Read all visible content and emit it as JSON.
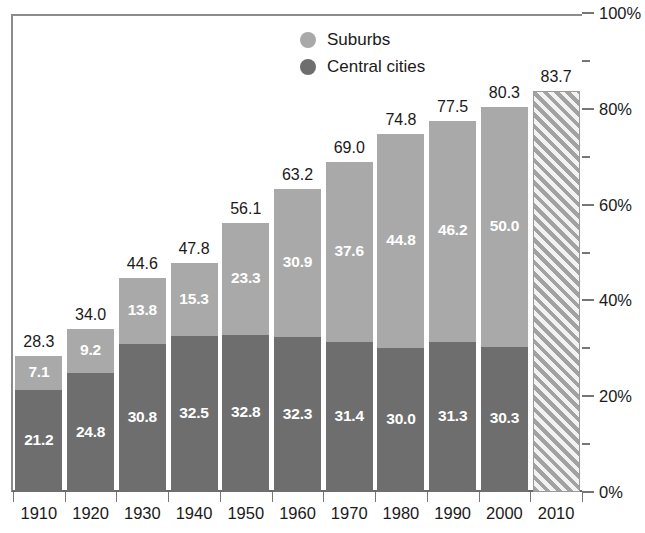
{
  "chart_data": {
    "type": "bar",
    "title": "",
    "subtitle": "",
    "xlabel": "",
    "ylabel": "",
    "ylim": [
      0,
      100
    ],
    "ytick_labels": [
      "0%",
      "20%",
      "40%",
      "60%",
      "80%",
      "100%"
    ],
    "ytick_values": [
      0,
      20,
      40,
      60,
      80,
      100
    ],
    "yminor_values": [
      10,
      30,
      50,
      70,
      90
    ],
    "grid": false,
    "stacked": true,
    "legend_position": "top-center",
    "categories": [
      "1910",
      "1920",
      "1930",
      "1940",
      "1950",
      "1960",
      "1970",
      "1980",
      "1990",
      "2000",
      "2010"
    ],
    "series": [
      {
        "name": "Central cities",
        "color": "#6e6e6e",
        "values": [
          21.2,
          24.8,
          30.8,
          32.5,
          32.8,
          32.3,
          31.4,
          30.0,
          31.3,
          30.3,
          null
        ]
      },
      {
        "name": "Suburbs",
        "color": "#a9a9a9",
        "values": [
          7.1,
          9.2,
          13.8,
          15.3,
          23.3,
          30.9,
          37.6,
          44.8,
          46.2,
          50.0,
          null
        ]
      }
    ],
    "totals": [
      28.3,
      34.0,
      44.6,
      47.8,
      56.1,
      63.2,
      69.0,
      74.8,
      77.5,
      80.3,
      83.7
    ],
    "projected_category": "2010",
    "projected_value": 83.7,
    "annotations": []
  },
  "legend": {
    "items": [
      {
        "label": "Suburbs",
        "color": "#a9a9a9",
        "icon": "circle-icon"
      },
      {
        "label": "Central cities",
        "color": "#6e6e6e",
        "icon": "circle-icon"
      }
    ]
  },
  "bars": [
    {
      "year": "1910",
      "central": "21.2",
      "suburb": "7.1",
      "total": "28.3",
      "projected": false
    },
    {
      "year": "1920",
      "central": "24.8",
      "suburb": "9.2",
      "total": "34.0",
      "projected": false
    },
    {
      "year": "1930",
      "central": "30.8",
      "suburb": "13.8",
      "total": "44.6",
      "projected": false
    },
    {
      "year": "1940",
      "central": "32.5",
      "suburb": "15.3",
      "total": "47.8",
      "projected": false
    },
    {
      "year": "1950",
      "central": "32.8",
      "suburb": "23.3",
      "total": "56.1",
      "projected": false
    },
    {
      "year": "1960",
      "central": "32.3",
      "suburb": "30.9",
      "total": "63.2",
      "projected": false
    },
    {
      "year": "1970",
      "central": "31.4",
      "suburb": "37.6",
      "total": "69.0",
      "projected": false
    },
    {
      "year": "1980",
      "central": "30.0",
      "suburb": "44.8",
      "total": "74.8",
      "projected": false
    },
    {
      "year": "1990",
      "central": "31.3",
      "suburb": "46.2",
      "total": "77.5",
      "projected": false
    },
    {
      "year": "2000",
      "central": "30.3",
      "suburb": "50.0",
      "total": "80.3",
      "projected": false
    },
    {
      "year": "2010",
      "central": "",
      "suburb": "",
      "total": "83.7",
      "projected": true
    }
  ],
  "yaxis": {
    "labels": [
      "100%",
      "80%",
      "60%",
      "40%",
      "20%",
      "0%"
    ],
    "values": [
      100,
      80,
      60,
      40,
      20,
      0
    ]
  }
}
